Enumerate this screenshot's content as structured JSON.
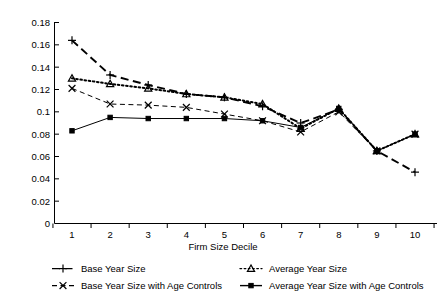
{
  "chart_data": {
    "type": "line",
    "title": "",
    "xlabel": "Firm Size Decile",
    "ylabel": "",
    "categories": [
      "1",
      "2",
      "3",
      "4",
      "5",
      "6",
      "7",
      "8",
      "9",
      "10"
    ],
    "x": [
      1,
      2,
      3,
      4,
      5,
      6,
      7,
      8,
      9,
      10
    ],
    "xlim": [
      0.5,
      10.5
    ],
    "ylim": [
      0,
      0.18
    ],
    "yticks": [
      "0",
      "0.02",
      "0.04",
      "0.06",
      "0.08",
      "0.1",
      "0.12",
      "0.14",
      "0.16",
      "0.18"
    ],
    "ytick_values": [
      0,
      0.02,
      0.04,
      0.06,
      0.08,
      0.1,
      0.12,
      0.14,
      0.16,
      0.18
    ],
    "grid": false,
    "legend_position": "bottom",
    "series": [
      {
        "name": "Base Year Size",
        "marker": "plus",
        "linestyle": "dashed",
        "values": [
          0.164,
          0.133,
          0.124,
          0.116,
          0.113,
          0.105,
          0.09,
          0.102,
          0.065,
          0.046
        ]
      },
      {
        "name": "Average Year Size",
        "marker": "triangle",
        "linestyle": "dotted",
        "values": [
          0.13,
          0.125,
          0.121,
          0.116,
          0.113,
          0.107,
          0.085,
          0.103,
          0.065,
          0.08
        ]
      },
      {
        "name": "Base Year Size with Age Controls",
        "marker": "cross",
        "linestyle": "dashed",
        "values": [
          0.121,
          0.107,
          0.106,
          0.104,
          0.098,
          0.092,
          0.082,
          0.1,
          0.065,
          0.08
        ]
      },
      {
        "name": "Average Year Size with Age Controls",
        "marker": "square",
        "linestyle": "solid",
        "values": [
          0.083,
          0.095,
          0.094,
          0.094,
          0.094,
          0.092,
          0.086,
          0.103,
          0.065,
          0.08
        ]
      }
    ]
  },
  "legend": {
    "items": [
      {
        "label": "Base Year Size"
      },
      {
        "label": "Average Year Size"
      },
      {
        "label": "Base Year Size with Age Controls"
      },
      {
        "label": "Average Year Size with Age Controls"
      }
    ]
  }
}
